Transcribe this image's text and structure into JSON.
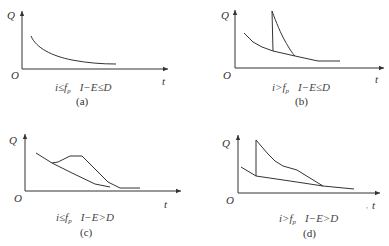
{
  "figure": {
    "panels": [
      {
        "id": "a",
        "y_label": "Q",
        "x_label": "t",
        "origin_label": "O",
        "condition_left": "i≤f",
        "condition_left_sub": "p",
        "condition_right": "I−E≤D",
        "caption": "(a)"
      },
      {
        "id": "b",
        "y_label": "Q",
        "x_label": "t",
        "origin_label": "O",
        "condition_left": "i>f",
        "condition_left_sub": "p",
        "condition_right": "I−E≤D",
        "caption": "(b)"
      },
      {
        "id": "c",
        "y_label": "Q",
        "x_label": "t",
        "origin_label": "O",
        "condition_left": "i≤f",
        "condition_left_sub": "p",
        "condition_right": "I−E>D",
        "caption": "(c)"
      },
      {
        "id": "d",
        "y_label": "Q",
        "x_label": "t",
        "origin_label": "O",
        "condition_left": "i>f",
        "condition_left_sub": "p",
        "condition_right": "I−E>D",
        "caption": "(d)"
      }
    ],
    "stray_mark": ","
  },
  "colors": {
    "line": "#333333",
    "background": "#ffffff"
  }
}
